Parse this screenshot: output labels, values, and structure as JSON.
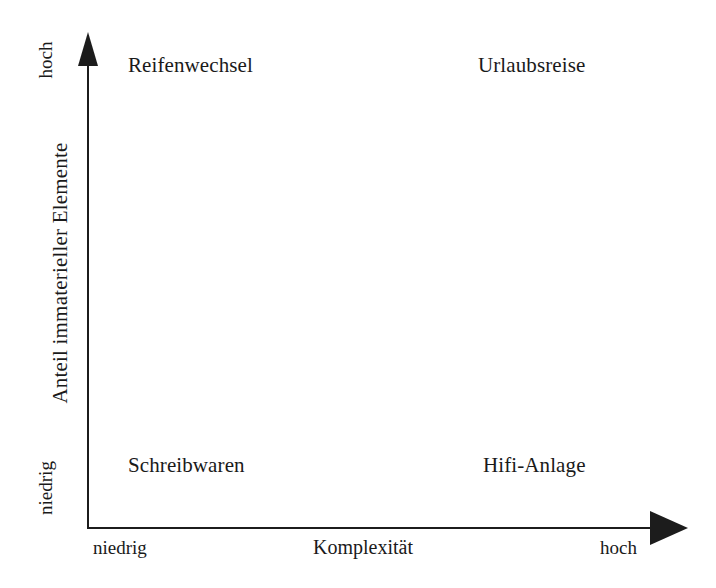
{
  "chart_data": {
    "type": "scatter",
    "title": "",
    "xlabel": "Komplexität",
    "ylabel": "Anteil immaterieller Elemente",
    "x_tick_labels": [
      "niedrig",
      "hoch"
    ],
    "y_tick_labels": [
      "niedrig",
      "hoch"
    ],
    "xlim": [
      "niedrig",
      "hoch"
    ],
    "ylim": [
      "niedrig",
      "hoch"
    ],
    "grid": false,
    "legend": "none",
    "axis_style": "two-arrow-axes",
    "points": [
      {
        "label": "Reifenwechsel",
        "x": "niedrig",
        "y": "hoch",
        "quadrant": "top-left"
      },
      {
        "label": "Urlaubsreise",
        "x": "hoch",
        "y": "hoch",
        "quadrant": "top-right"
      },
      {
        "label": "Schreibwaren",
        "x": "niedrig",
        "y": "niedrig",
        "quadrant": "bottom-left"
      },
      {
        "label": "Hifi-Anlage",
        "x": "hoch",
        "y": "niedrig",
        "quadrant": "bottom-right"
      }
    ]
  },
  "axes": {
    "y": {
      "title": "Anteil immaterieller Elemente",
      "tick_high": "hoch",
      "tick_low": "niedrig",
      "arrow_icon": "arrow-up-icon",
      "line_icon": "vertical-axis-line"
    },
    "x": {
      "title": "Komplexität",
      "tick_low": "niedrig",
      "tick_high": "hoch",
      "arrow_icon": "arrow-right-icon",
      "line_icon": "horizontal-axis-line"
    }
  },
  "quadrants": {
    "top_left": "Reifenwechsel",
    "top_right": "Urlaubsreise",
    "bottom_left": "Schreibwaren",
    "bottom_right": "Hifi-Anlage"
  },
  "colors": {
    "background": "#ffffff",
    "ink": "#1a1a1a",
    "axis": "#1c1c1c"
  }
}
